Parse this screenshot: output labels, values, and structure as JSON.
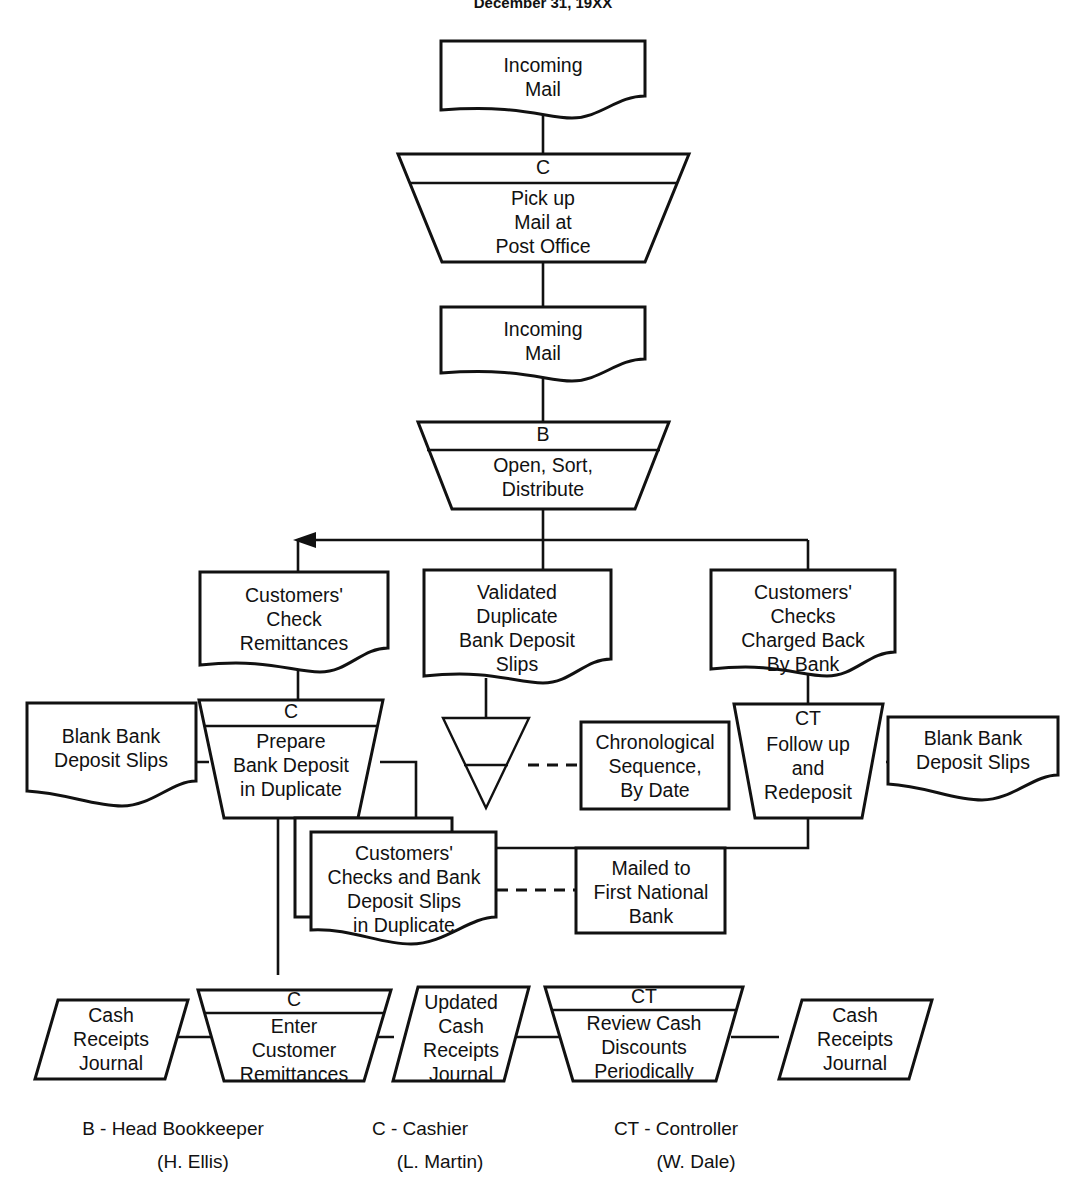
{
  "title": "December 31, 19XX",
  "diagram": {
    "kind": "accounting-system-flowchart",
    "nodes": [
      {
        "id": "incoming-mail-1",
        "shape": "document",
        "lines": [
          "Incoming",
          "Mail"
        ]
      },
      {
        "id": "pick-up-mail",
        "shape": "process-trapezoid",
        "role": "C",
        "lines": [
          "Pick up",
          "Mail at",
          "Post Office"
        ]
      },
      {
        "id": "incoming-mail-2",
        "shape": "document",
        "lines": [
          "Incoming",
          "Mail"
        ]
      },
      {
        "id": "open-sort-distribute",
        "shape": "process-trapezoid",
        "role": "B",
        "lines": [
          "Open, Sort,",
          "Distribute"
        ]
      },
      {
        "id": "customers-check-remittances",
        "shape": "document",
        "lines": [
          "Customers'",
          "Check",
          "Remittances"
        ]
      },
      {
        "id": "validated-duplicate-slips",
        "shape": "document",
        "lines": [
          "Validated",
          "Duplicate",
          "Bank Deposit",
          "Slips"
        ]
      },
      {
        "id": "customers-checks-charged-back",
        "shape": "document",
        "lines": [
          "Customers'",
          "Checks",
          "Charged Back",
          "By Bank"
        ]
      },
      {
        "id": "blank-bank-deposit-slips-left",
        "shape": "document",
        "lines": [
          "Blank Bank",
          "Deposit Slips"
        ]
      },
      {
        "id": "prepare-bank-deposit",
        "shape": "process-trapezoid",
        "role": "C",
        "lines": [
          "Prepare",
          "Bank Deposit",
          "in Duplicate"
        ]
      },
      {
        "id": "file-triangle",
        "shape": "file",
        "lines": []
      },
      {
        "id": "chronological-sequence",
        "shape": "annotation",
        "lines": [
          "Chronological",
          "Sequence,",
          "By Date"
        ]
      },
      {
        "id": "follow-up-redeposit",
        "shape": "process-trapezoid-plain",
        "role": "CT",
        "lines": [
          "Follow up",
          "and",
          "Redeposit"
        ]
      },
      {
        "id": "blank-bank-deposit-slips-right",
        "shape": "document",
        "lines": [
          "Blank Bank",
          "Deposit Slips"
        ]
      },
      {
        "id": "customers-checks-and-slips",
        "shape": "document-stacked",
        "lines": [
          "Customers'",
          "Checks and Bank",
          "Deposit Slips",
          "in Duplicate"
        ]
      },
      {
        "id": "mailed-to-bank",
        "shape": "annotation",
        "lines": [
          "Mailed to",
          "First National",
          "Bank"
        ]
      },
      {
        "id": "cash-receipts-journal-left",
        "shape": "parallelogram",
        "lines": [
          "Cash",
          "Receipts",
          "Journal"
        ]
      },
      {
        "id": "enter-customer-remittances",
        "shape": "process-trapezoid",
        "role": "C",
        "lines": [
          "Enter",
          "Customer",
          "Remittances"
        ]
      },
      {
        "id": "updated-cash-receipts-journal",
        "shape": "parallelogram",
        "lines": [
          "Updated",
          "Cash",
          "Receipts",
          "Journal"
        ]
      },
      {
        "id": "review-cash-discounts",
        "shape": "process-trapezoid",
        "role": "CT",
        "lines": [
          "Review Cash",
          "Discounts",
          "Periodically"
        ]
      },
      {
        "id": "cash-receipts-journal-right",
        "shape": "parallelogram",
        "lines": [
          "Cash",
          "Receipts",
          "Journal"
        ]
      }
    ]
  },
  "legend": [
    {
      "code": "B - Head Bookkeeper",
      "person": "(H. Ellis)"
    },
    {
      "code": "C - Cashier",
      "person": "(L. Martin)"
    },
    {
      "code": "CT - Controller",
      "person": "(W. Dale)"
    }
  ],
  "colors": {
    "ink": "#111111",
    "paper": "#ffffff"
  }
}
